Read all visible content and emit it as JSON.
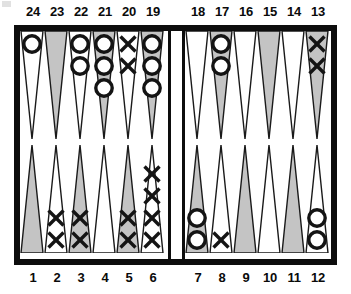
{
  "board": {
    "title": "backgammon-board",
    "frame_color": "#0d0d0d",
    "field_color": "#ffffff",
    "point_shaded_color": "#c4c4c4",
    "point_plain_color": "#ffffff",
    "checker_outline_color": "#141414",
    "bar_checkers": 0,
    "top_labels": [
      "24",
      "23",
      "22",
      "21",
      "20",
      "19",
      "18",
      "17",
      "16",
      "15",
      "14",
      "13"
    ],
    "bottom_labels": [
      "1",
      "2",
      "3",
      "4",
      "5",
      "6",
      "7",
      "8",
      "9",
      "10",
      "11",
      "12"
    ],
    "points": [
      {
        "number": "24",
        "row": "top",
        "quadrant": "top-left",
        "slot": 0,
        "shaded": false,
        "checker": "O",
        "count": 1
      },
      {
        "number": "23",
        "row": "top",
        "quadrant": "top-left",
        "slot": 1,
        "shaded": true,
        "checker": "",
        "count": 0
      },
      {
        "number": "22",
        "row": "top",
        "quadrant": "top-left",
        "slot": 2,
        "shaded": false,
        "checker": "O",
        "count": 2
      },
      {
        "number": "21",
        "row": "top",
        "quadrant": "top-left",
        "slot": 3,
        "shaded": true,
        "checker": "O",
        "count": 3
      },
      {
        "number": "20",
        "row": "top",
        "quadrant": "top-left",
        "slot": 4,
        "shaded": false,
        "checker": "X",
        "count": 2
      },
      {
        "number": "19",
        "row": "top",
        "quadrant": "top-left",
        "slot": 5,
        "shaded": true,
        "checker": "O",
        "count": 3
      },
      {
        "number": "18",
        "row": "top",
        "quadrant": "top-right",
        "slot": 0,
        "shaded": false,
        "checker": "",
        "count": 0
      },
      {
        "number": "17",
        "row": "top",
        "quadrant": "top-right",
        "slot": 1,
        "shaded": true,
        "checker": "O",
        "count": 2
      },
      {
        "number": "16",
        "row": "top",
        "quadrant": "top-right",
        "slot": 2,
        "shaded": false,
        "checker": "",
        "count": 0
      },
      {
        "number": "15",
        "row": "top",
        "quadrant": "top-right",
        "slot": 3,
        "shaded": true,
        "checker": "",
        "count": 0
      },
      {
        "number": "14",
        "row": "top",
        "quadrant": "top-right",
        "slot": 4,
        "shaded": false,
        "checker": "",
        "count": 0
      },
      {
        "number": "13",
        "row": "top",
        "quadrant": "top-right",
        "slot": 5,
        "shaded": true,
        "checker": "X",
        "count": 2
      },
      {
        "number": "1",
        "row": "bottom",
        "quadrant": "bot-left",
        "slot": 0,
        "shaded": true,
        "checker": "",
        "count": 0
      },
      {
        "number": "2",
        "row": "bottom",
        "quadrant": "bot-left",
        "slot": 1,
        "shaded": false,
        "checker": "X",
        "count": 2
      },
      {
        "number": "3",
        "row": "bottom",
        "quadrant": "bot-left",
        "slot": 2,
        "shaded": true,
        "checker": "X",
        "count": 2
      },
      {
        "number": "4",
        "row": "bottom",
        "quadrant": "bot-left",
        "slot": 3,
        "shaded": false,
        "checker": "",
        "count": 0
      },
      {
        "number": "5",
        "row": "bottom",
        "quadrant": "bot-left",
        "slot": 4,
        "shaded": true,
        "checker": "X",
        "count": 2
      },
      {
        "number": "6",
        "row": "bottom",
        "quadrant": "bot-left",
        "slot": 5,
        "shaded": false,
        "checker": "X",
        "count": 4
      },
      {
        "number": "7",
        "row": "bottom",
        "quadrant": "bot-right",
        "slot": 0,
        "shaded": true,
        "checker": "O",
        "count": 2
      },
      {
        "number": "8",
        "row": "bottom",
        "quadrant": "bot-right",
        "slot": 1,
        "shaded": false,
        "checker": "X",
        "count": 1
      },
      {
        "number": "9",
        "row": "bottom",
        "quadrant": "bot-right",
        "slot": 2,
        "shaded": true,
        "checker": "",
        "count": 0
      },
      {
        "number": "10",
        "row": "bottom",
        "quadrant": "bot-right",
        "slot": 3,
        "shaded": false,
        "checker": "",
        "count": 0
      },
      {
        "number": "11",
        "row": "bottom",
        "quadrant": "bot-right",
        "slot": 4,
        "shaded": true,
        "checker": "",
        "count": 0
      },
      {
        "number": "12",
        "row": "bottom",
        "quadrant": "bot-right",
        "slot": 5,
        "shaded": false,
        "checker": "O",
        "count": 2
      }
    ]
  }
}
